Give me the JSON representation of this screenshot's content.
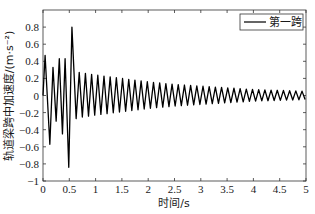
{
  "chart_data": {
    "type": "line",
    "title": "",
    "xlabel": "时间/s",
    "ylabel": "轨道梁跨中加速度/(m·s⁻²)",
    "xlim": [
      0,
      5
    ],
    "ylim": [
      -1,
      1
    ],
    "xticks": [
      0,
      0.5,
      1,
      1.5,
      2,
      2.5,
      3,
      3.5,
      4,
      4.5,
      5
    ],
    "xtick_labels": [
      "0",
      "0.5",
      "1",
      "1.5",
      "2",
      "2.5",
      "3",
      "3.5",
      "4",
      "4.5",
      "5"
    ],
    "yticks": [
      -1,
      -0.8,
      -0.6,
      -0.4,
      -0.2,
      0,
      0.2,
      0.4,
      0.6,
      0.8
    ],
    "ytick_labels": [
      "−1",
      "−0.8",
      "−0.6",
      "−0.4",
      "−0.2",
      "0",
      "0.2",
      "0.4",
      "0.6",
      "0.8"
    ],
    "grid": false,
    "legend_position": "upper right",
    "series": [
      {
        "name": "第一跨",
        "color": "#000000",
        "description": "Decaying oscillation (~8.5 Hz); transient peaks during first 0.55 s with max +0.80 and min −0.84 near t≈0.5 s; amplitude decays from ~0.27 at 0.6 s to ~0.15 at 2 s and ~0.05 at 5 s",
        "extrema": [
          {
            "t": 0.0,
            "v": 0.0
          },
          {
            "t": 0.04,
            "v": 0.47
          },
          {
            "t": 0.13,
            "v": -0.57
          },
          {
            "t": 0.19,
            "v": 0.33
          },
          {
            "t": 0.25,
            "v": -0.3
          },
          {
            "t": 0.31,
            "v": 0.43
          },
          {
            "t": 0.37,
            "v": -0.45
          },
          {
            "t": 0.42,
            "v": 0.43
          },
          {
            "t": 0.49,
            "v": -0.84
          },
          {
            "t": 0.55,
            "v": 0.8
          },
          {
            "t": 0.63,
            "v": -0.27
          }
        ],
        "envelope": [
          {
            "t": 0.7,
            "amp": 0.27
          },
          {
            "t": 1.0,
            "amp": 0.24
          },
          {
            "t": 1.5,
            "amp": 0.2
          },
          {
            "t": 2.0,
            "amp": 0.16
          },
          {
            "t": 2.5,
            "amp": 0.13
          },
          {
            "t": 3.0,
            "amp": 0.11
          },
          {
            "t": 3.5,
            "amp": 0.09
          },
          {
            "t": 4.0,
            "amp": 0.07
          },
          {
            "t": 4.5,
            "amp": 0.06
          },
          {
            "t": 5.0,
            "amp": 0.05
          }
        ],
        "frequency_hz": 8.5
      }
    ]
  },
  "legend": {
    "label": "第一跨"
  },
  "axes": {
    "xlabel": "时间/s",
    "ylabel": "轨道梁跨中加速度/(m·s⁻²)"
  }
}
